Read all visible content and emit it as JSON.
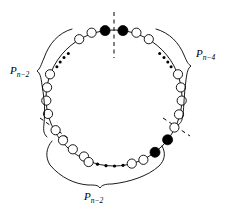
{
  "figure": {
    "type": "cycle-graph-diagram",
    "background_color": "#ffffff",
    "stroke_color": "#000000",
    "labels": [
      {
        "id": "left",
        "base": "P",
        "subscript": "n−2",
        "text": "P n−2",
        "x": 14,
        "y": 72
      },
      {
        "id": "right",
        "base": "P",
        "subscript": "n−4",
        "text": "P n−4",
        "x": 200,
        "y": 56
      },
      {
        "id": "bottom",
        "base": "P",
        "subscript": "n−2",
        "text": "P n−2",
        "x": 88,
        "y": 196
      }
    ],
    "ring": {
      "center_x": 114,
      "center_y": 98,
      "radius": 68,
      "open_vertex_count": 22,
      "filled_vertex_count": 4,
      "open_vertex_radius": 4.6,
      "filled_vertex_radius": 5.0,
      "open_vertex_fill": "#ffffff",
      "filled_vertex_fill": "#000000"
    },
    "open_vertices_deg": [
      74,
      60,
      46,
      -16,
      -30,
      -44,
      -58,
      -72,
      -86,
      -100,
      -114,
      -128,
      -158,
      -172,
      106,
      120,
      134,
      170,
      184,
      198,
      212,
      226
    ],
    "filled_vertices_deg": [
      82.5,
      97.5,
      -142,
      -127
    ],
    "ellipsis_groups": [
      {
        "id": "top-left",
        "dots": 4,
        "start_deg": 132,
        "end_deg": 152
      },
      {
        "id": "top-right",
        "dots": 4,
        "start_deg": 28,
        "end_deg": 48
      },
      {
        "id": "bottom",
        "dots": 4,
        "start_deg": 256,
        "end_deg": 284
      }
    ],
    "dashed_lines": [
      {
        "id": "vertical-symmetry-axis",
        "x1": 114,
        "y1": 10,
        "x2": 114,
        "y2": 58
      },
      {
        "id": "cut-lower-right",
        "x1": 162,
        "y1": 118,
        "x2": 190,
        "y2": 138
      },
      {
        "id": "cut-lower-left",
        "x1": 40,
        "y1": 120,
        "x2": 70,
        "y2": 140
      }
    ],
    "braces": [
      {
        "id": "brace-left",
        "label_ref": "left"
      },
      {
        "id": "brace-right",
        "label_ref": "right"
      },
      {
        "id": "brace-bottom",
        "label_ref": "bottom"
      }
    ]
  }
}
